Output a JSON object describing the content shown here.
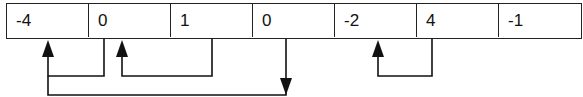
{
  "diagram": {
    "type": "array-with-link-arrows",
    "cells": [
      {
        "index": 0,
        "value": "-4"
      },
      {
        "index": 1,
        "value": "0"
      },
      {
        "index": 2,
        "value": "1"
      },
      {
        "index": 3,
        "value": "0"
      },
      {
        "index": 4,
        "value": "-2"
      },
      {
        "index": 5,
        "value": "4"
      },
      {
        "index": 6,
        "value": "-1"
      }
    ],
    "arrows": [
      {
        "from": 1,
        "to": 0,
        "direction": "up-into-target"
      },
      {
        "from": 2,
        "to": 1,
        "direction": "up-into-target"
      },
      {
        "from": 0,
        "to": 3,
        "direction": "down-at-target"
      },
      {
        "from": 5,
        "to": 4,
        "direction": "up-into-target"
      }
    ],
    "colors": {
      "stroke": "#111111",
      "background": "#ffffff"
    }
  }
}
